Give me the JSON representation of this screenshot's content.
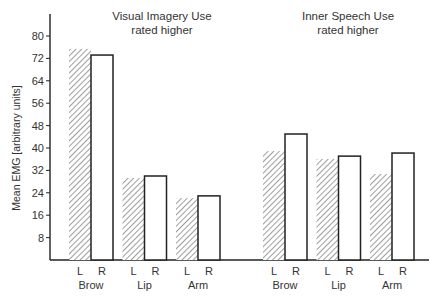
{
  "chart_data": {
    "type": "bar",
    "title": "",
    "xlabel": "",
    "ylabel": "Mean EMG [arbitrary units]",
    "ylim": [
      0,
      88
    ],
    "yticks": [
      8,
      16,
      24,
      32,
      40,
      48,
      56,
      64,
      72,
      80
    ],
    "grid": false,
    "legend": {
      "position": "none",
      "entries": [
        {
          "name": "L",
          "style": "hatched"
        },
        {
          "name": "R",
          "style": "open"
        }
      ]
    },
    "panels": [
      {
        "title_line1": "Visual Imagery Use",
        "title_line2": "rated higher",
        "categories": [
          "Brow",
          "Lip",
          "Arm"
        ],
        "series": [
          {
            "name": "L",
            "values": [
              75.4,
              29.3,
              22.1
            ]
          },
          {
            "name": "R",
            "values": [
              73.2,
              30.0,
              22.9
            ]
          }
        ]
      },
      {
        "title_line1": "Inner Speech Use",
        "title_line2": "rated higher",
        "categories": [
          "Brow",
          "Lip",
          "Arm"
        ],
        "series": [
          {
            "name": "L",
            "values": [
              38.9,
              36.1,
              30.7
            ]
          },
          {
            "name": "R",
            "values": [
              45.0,
              37.1,
              38.2
            ]
          }
        ]
      }
    ]
  }
}
